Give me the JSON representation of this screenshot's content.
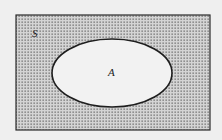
{
  "diagram": {
    "type": "venn",
    "universe": {
      "label": "S",
      "fill": "stippled"
    },
    "sets": [
      {
        "label": "A",
        "fill": "#f2f2f2"
      }
    ],
    "colors": {
      "background": "#efefef",
      "stipple": "#6a6a6a",
      "stroke": "#2a2a2a"
    }
  }
}
